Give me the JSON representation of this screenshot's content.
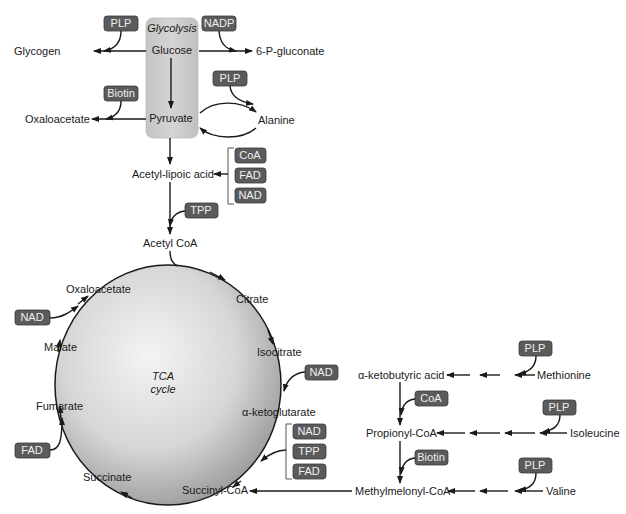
{
  "colors": {
    "cofactor_fill": "#5b5b5b",
    "cofactor_text": "#f0f0f0",
    "glycolysis_box": "#c8c8c8",
    "tca_circle_center": "#f2f2f2",
    "tca_circle_edge": "#9a9a9a",
    "line": "#1a1a1a"
  },
  "glycolysis": {
    "title": "Glycolysis",
    "glucose": "Glucose",
    "pyruvate": "Pyruvate"
  },
  "metabolites": {
    "glycogen": "Glycogen",
    "six_p_gluconate": "6-P-gluconate",
    "oxaloacetate_top": "Oxaloacetate",
    "alanine": "Alanine",
    "acetyl_lipoic_acid": "Acetyl-lipoic acid",
    "acetyl_coa": "Acetyl CoA",
    "alpha_ketobutyric_acid": "α-ketobutyric acid",
    "methionine": "Methionine",
    "propionyl_coa": "Propionyl-CoA",
    "isoleucine": "Isoleucine",
    "methylmelonyl_coa": "Methylmelonyl-CoA",
    "valine": "Valine"
  },
  "tca": {
    "title_line1": "TCA",
    "title_line2": "cycle",
    "oxaloacetate": "Oxaloacetate",
    "citrate": "Citrate",
    "isocitrate": "Isocitrate",
    "alpha_ketoglutarate": "α-ketoglutarate",
    "succinyl_coa": "Succinyl-CoA",
    "succinate": "Succinate",
    "fumarate": "Fumarate",
    "malate": "Malate"
  },
  "cofactors": {
    "plp_glycogen": "PLP",
    "nadp": "NADP",
    "plp_alanine": "PLP",
    "biotin_oxaloacetate": "Biotin",
    "coa_pdh": "CoA",
    "fad_pdh": "FAD",
    "nad_pdh": "NAD",
    "tpp_pdh": "TPP",
    "nad_malate": "NAD",
    "fad_fumarate": "FAD",
    "nad_isocitrate": "NAD",
    "nad_akg": "NAD",
    "tpp_akg": "TPP",
    "fad_akg": "FAD",
    "plp_methionine": "PLP",
    "coa_propionyl": "CoA",
    "plp_isoleucine": "PLP",
    "biotin_propionyl": "Biotin",
    "plp_valine": "PLP"
  }
}
